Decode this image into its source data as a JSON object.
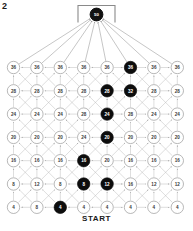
{
  "figure": {
    "label": "2",
    "start_label": "START"
  },
  "goal": {
    "value": "50",
    "name": "goal-node"
  },
  "lattice": {
    "rows": 7,
    "cols": 8,
    "node_values": [
      [
        "36",
        "36",
        "36",
        "36",
        "36",
        "36",
        "36",
        "36"
      ],
      [
        "28",
        "28",
        "28",
        "28",
        "28",
        "32",
        "28",
        "28"
      ],
      [
        "24",
        "24",
        "24",
        "28",
        "24",
        "28",
        "24",
        "24"
      ],
      [
        "20",
        "20",
        "20",
        "24",
        "20",
        "20",
        "20",
        "20"
      ],
      [
        "16",
        "16",
        "16",
        "16",
        "20",
        "16",
        "16",
        "16"
      ],
      [
        "8",
        "12",
        "8",
        "8",
        "12",
        "16",
        "12",
        "12"
      ],
      [
        "4",
        "8",
        "4",
        "4",
        "4",
        "4",
        "4",
        "4"
      ]
    ],
    "highlighted": [
      [
        0,
        5
      ],
      [
        1,
        4
      ],
      [
        1,
        5
      ],
      [
        2,
        4
      ],
      [
        3,
        4
      ],
      [
        4,
        3
      ],
      [
        5,
        3
      ],
      [
        5,
        4
      ],
      [
        6,
        2
      ]
    ]
  },
  "colors": {
    "highlight": "#0d0d0d",
    "node_stroke": "#9a9a9a",
    "node_fill": "#ffffff",
    "edge": "#b5b5b5",
    "text": "#3a3a3a",
    "text_highlight": "#ffffff"
  }
}
